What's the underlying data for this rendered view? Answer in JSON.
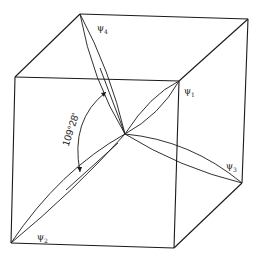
{
  "figure": {
    "angle_label": "109°28'",
    "orbitals": [
      {
        "id": "psi1",
        "symbol": "ψ",
        "subscript": "1"
      },
      {
        "id": "psi2",
        "symbol": "ψ",
        "subscript": "2"
      },
      {
        "id": "psi3",
        "symbol": "ψ",
        "subscript": "3"
      },
      {
        "id": "psi4",
        "symbol": "ψ",
        "subscript": "4"
      }
    ],
    "colors": {
      "line": "#1a1a1a",
      "background": "#ffffff"
    }
  }
}
